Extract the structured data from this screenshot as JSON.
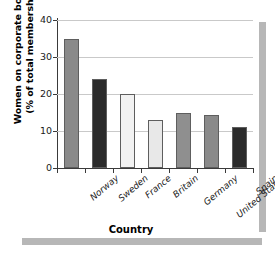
{
  "chart_data": {
    "type": "bar",
    "title": "",
    "xlabel": "Country",
    "ylabel_line1": "Women on corporate boards",
    "ylabel_line2": "(% of total membership)",
    "categories": [
      "Norway",
      "Sweden",
      "France",
      "Britain",
      "Germany",
      "United States",
      "Spain"
    ],
    "values": [
      35,
      24,
      20,
      13,
      15,
      14.2,
      11
    ],
    "ylim": [
      0,
      40
    ],
    "yticks": [
      0,
      10,
      20,
      30,
      40
    ],
    "ytick_labels": [
      "0",
      "10",
      "20",
      "30",
      "40"
    ],
    "grid": "horizontal",
    "legend": "none",
    "bar_colors": [
      "#8a8a8a",
      "#2b2b2b",
      "#f2f2f2",
      "#e8e8e8",
      "#8f8f8f",
      "#8a8a8a",
      "#2b2b2b"
    ],
    "bar_edge_color": "#5e5e5e",
    "gridline_color": "#c9c9c9",
    "axis_color": "#3a3a3a",
    "decoration_color": "#b7b7b7",
    "background": "#ffffff"
  }
}
